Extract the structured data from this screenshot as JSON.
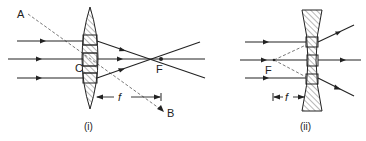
{
  "diagrams": [
    {
      "caption": "(i)",
      "lens_type": "converging (convex)",
      "labels": {
        "a": "A",
        "b": "B",
        "c": "C",
        "f_point": "F",
        "focal_length": "f"
      }
    },
    {
      "caption": "(ii)",
      "lens_type": "diverging (concave)",
      "labels": {
        "f_point": "F",
        "focal_length": "f"
      }
    }
  ],
  "colors": {
    "ink": "#222222",
    "background": "#ffffff",
    "dashed": "#555555"
  }
}
